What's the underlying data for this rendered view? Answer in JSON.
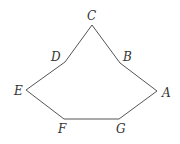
{
  "figure": {
    "type": "heptagon-outline",
    "stroke_color": "#555555",
    "background": "#ffffff"
  },
  "vertices": {
    "A": {
      "label": "A",
      "x": 157,
      "y": 91
    },
    "B": {
      "label": "B",
      "x": 120,
      "y": 63
    },
    "C": {
      "label": "C",
      "x": 92,
      "y": 25
    },
    "D": {
      "label": "D",
      "x": 65,
      "y": 62
    },
    "E": {
      "label": "E",
      "x": 26,
      "y": 90
    },
    "F": {
      "label": "F",
      "x": 64,
      "y": 119
    },
    "G": {
      "label": "G",
      "x": 119,
      "y": 119
    }
  },
  "labels": {
    "A": "A",
    "B": "B",
    "C": "C",
    "D": "D",
    "E": "E",
    "F": "F",
    "G": "G"
  }
}
